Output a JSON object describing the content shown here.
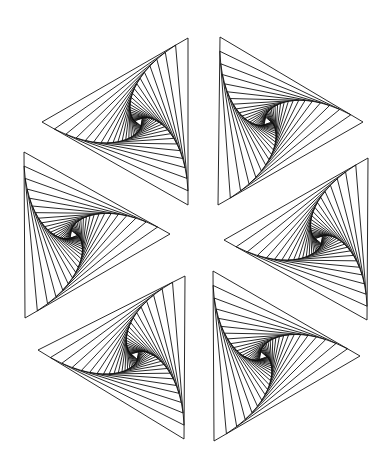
{
  "artwork": {
    "title": "",
    "background": "#ffffff",
    "stroke": "#111111",
    "stroke_width": 0.9,
    "iterations": 24,
    "step_fraction": 0.085,
    "rotation": "counterclockwise",
    "triangles": [
      {
        "name": "top-left",
        "vertices": [
          [
            188,
            38
          ],
          [
            42,
            122
          ],
          [
            188,
            205
          ]
        ]
      },
      {
        "name": "top-right",
        "vertices": [
          [
            220,
            37
          ],
          [
            218,
            205
          ],
          [
            363,
            122
          ]
        ]
      },
      {
        "name": "middle-left",
        "vertices": [
          [
            24,
            152
          ],
          [
            25,
            318
          ],
          [
            170,
            234
          ]
        ]
      },
      {
        "name": "middle-right",
        "vertices": [
          [
            368,
            158
          ],
          [
            224,
            240
          ],
          [
            367,
            320
          ]
        ]
      },
      {
        "name": "bottom-left",
        "vertices": [
          [
            185,
            276
          ],
          [
            38,
            350
          ],
          [
            184,
            439
          ]
        ]
      },
      {
        "name": "bottom-right",
        "vertices": [
          [
            213,
            271
          ],
          [
            214,
            441
          ],
          [
            360,
            356
          ]
        ]
      }
    ]
  }
}
